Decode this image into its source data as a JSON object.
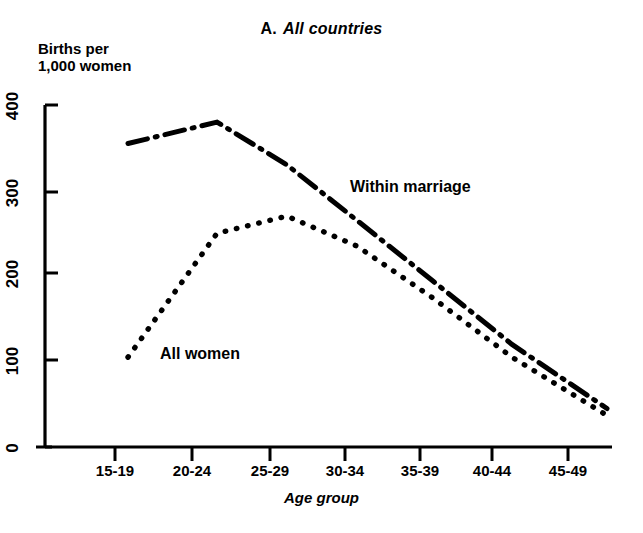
{
  "title": {
    "prefix": "A.",
    "main": "All countries"
  },
  "axis": {
    "y_label": "Births per\n1,000 women",
    "x_label": "Age group",
    "y_ticks": [
      "0",
      "100",
      "200",
      "300",
      "400"
    ],
    "x_ticks": [
      "15-19",
      "20-24",
      "25-29",
      "30-34",
      "35-39",
      "40-44",
      "45-49"
    ]
  },
  "series_labels": {
    "within_marriage": "Within marriage",
    "all_women": "All women"
  },
  "colors": {
    "ink": "#000000",
    "background": "#ffffff"
  },
  "chart_data": {
    "type": "line",
    "xlabel": "Age group",
    "ylabel": "Births per 1,000 women",
    "categories": [
      "15-19",
      "20-24",
      "25-29",
      "30-34",
      "35-39",
      "40-44",
      "45-49"
    ],
    "ylim": [
      0,
      400
    ],
    "yticks": [
      0,
      100,
      200,
      300,
      400
    ],
    "grid": false,
    "legend": "inline-annotation",
    "series": [
      {
        "name": "Within marriage",
        "style": "dash-dot",
        "values": [
          355,
          380,
          330,
          265,
          195,
          120,
          45
        ]
      },
      {
        "name": "All women",
        "style": "dotted",
        "values": [
          105,
          250,
          270,
          235,
          175,
          105,
          37
        ]
      }
    ]
  }
}
